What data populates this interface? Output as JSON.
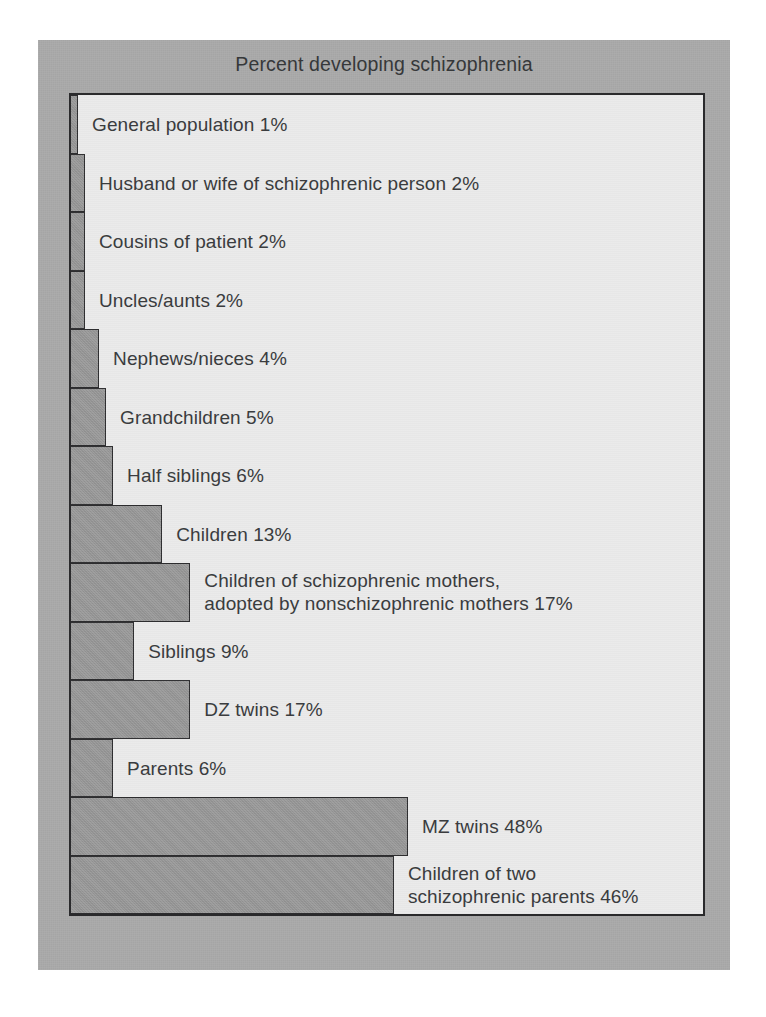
{
  "figure": {
    "title": "Percent developing schizophrenia",
    "colors": {
      "mat": "#a9a9a9",
      "plot_background": "#eaeaea",
      "bar_fill": "#979797",
      "bar_border": "#2d2d2f",
      "text": "#3a3c3e"
    }
  },
  "chart_data": {
    "type": "bar",
    "orientation": "horizontal",
    "title": "Percent developing schizophrenia",
    "xlabel": "",
    "ylabel": "",
    "xlim": [
      0,
      50
    ],
    "grid": false,
    "legend": null,
    "value_unit": "%",
    "categories": [
      "General population",
      "Husband or wife of schizophrenic person",
      "Cousins of patient",
      "Uncles/aunts",
      "Nephews/nieces",
      "Grandchildren",
      "Half siblings",
      "Children",
      "Children of schizophrenic mothers, adopted by nonschizophrenic mothers",
      "Siblings",
      "DZ twins",
      "Parents",
      "MZ twins",
      "Children of two schizophrenic parents"
    ],
    "values": [
      1,
      2,
      2,
      2,
      4,
      5,
      6,
      13,
      17,
      9,
      17,
      6,
      48,
      46
    ],
    "bars": [
      {
        "label": "General population 1%",
        "label_lines": "General population 1%",
        "value": 1
      },
      {
        "label": "Husband or wife of schizophrenic person 2%",
        "label_lines": "Husband or wife of schizophrenic person 2%",
        "value": 2
      },
      {
        "label": "Cousins of patient 2%",
        "label_lines": "Cousins of patient 2%",
        "value": 2
      },
      {
        "label": "Uncles/aunts 2%",
        "label_lines": "Uncles/aunts 2%",
        "value": 2
      },
      {
        "label": "Nephews/nieces 4%",
        "label_lines": "Nephews/nieces 4%",
        "value": 4
      },
      {
        "label": "Grandchildren 5%",
        "label_lines": "Grandchildren 5%",
        "value": 5
      },
      {
        "label": "Half siblings 6%",
        "label_lines": "Half siblings 6%",
        "value": 6
      },
      {
        "label": "Children 13%",
        "label_lines": "Children 13%",
        "value": 13
      },
      {
        "label": "Children of schizophrenic mothers, adopted by nonschizophrenic mothers 17%",
        "label_lines": "Children of schizophrenic mothers,\nadopted by nonschizophrenic mothers 17%",
        "value": 17
      },
      {
        "label": "Siblings 9%",
        "label_lines": "Siblings 9%",
        "value": 9
      },
      {
        "label": "DZ twins 17%",
        "label_lines": "DZ twins 17%",
        "value": 17
      },
      {
        "label": "Parents 6%",
        "label_lines": "Parents 6%",
        "value": 6
      },
      {
        "label": "MZ twins 48%",
        "label_lines": "MZ twins 48%",
        "value": 48
      },
      {
        "label": "Children of two schizophrenic parents 46%",
        "label_lines": "Children of two\nschizophrenic parents 46%",
        "value": 46
      }
    ]
  }
}
